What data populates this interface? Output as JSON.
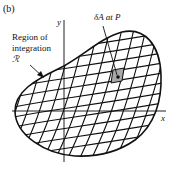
{
  "figure": {
    "panel_label": "(b)",
    "region_label_line1": "Region of",
    "region_label_line2": "integration",
    "region_symbol": "ℛ",
    "element_label": "δA at P",
    "x_axis_label": "x",
    "y_axis_label": "y",
    "colors": {
      "line": "#111111",
      "shaded_cell": "#a8a8a8",
      "background": "#ffffff"
    }
  }
}
